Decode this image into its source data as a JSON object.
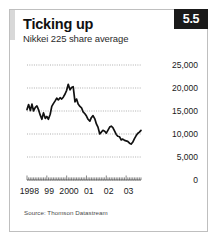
{
  "card": {
    "title": "Ticking up",
    "subtitle": "Nikkei 225 share average",
    "badge": "5.5",
    "source": "Source: Thomson Datastream",
    "accent_color": "#d8d8d8",
    "badge_bg": "#1a1a1a",
    "badge_fg": "#ffffff",
    "line_color": "#111111",
    "grid_color": "#9a9a9a",
    "border_color": "#bfbfbf"
  },
  "chart_data": {
    "type": "line",
    "title": "Ticking up",
    "subtitle": "Nikkei 225 share average",
    "xlabel": "",
    "ylabel": "",
    "ylim": [
      0,
      25000
    ],
    "xlim": [
      1998.0,
      2003.75
    ],
    "grid": true,
    "legend": null,
    "ytick_labels": [
      "25,000",
      "20,000",
      "15,000",
      "10,000",
      "5,000",
      "0"
    ],
    "ytick_values": [
      25000,
      20000,
      15000,
      10000,
      5000,
      0
    ],
    "xtick_labels": [
      "1998",
      "99",
      "2000",
      "01",
      "02",
      "03"
    ],
    "xtick_values": [
      1998,
      1999,
      2000,
      2001,
      2002,
      2003
    ],
    "series": [
      {
        "name": "Nikkei 225",
        "x": [
          1998.0,
          1998.08,
          1998.17,
          1998.25,
          1998.33,
          1998.42,
          1998.5,
          1998.58,
          1998.67,
          1998.75,
          1998.83,
          1998.92,
          1999.0,
          1999.08,
          1999.17,
          1999.25,
          1999.33,
          1999.42,
          1999.5,
          1999.58,
          1999.67,
          1999.75,
          1999.83,
          1999.92,
          2000.0,
          2000.08,
          2000.17,
          2000.25,
          2000.33,
          2000.42,
          2000.5,
          2000.58,
          2000.67,
          2000.75,
          2000.83,
          2000.92,
          2001.0,
          2001.08,
          2001.17,
          2001.25,
          2001.33,
          2001.42,
          2001.5,
          2001.58,
          2001.67,
          2001.75,
          2001.83,
          2001.92,
          2002.0,
          2002.08,
          2002.17,
          2002.25,
          2002.33,
          2002.42,
          2002.5,
          2002.58,
          2002.67,
          2002.75,
          2002.83,
          2002.92,
          2003.0,
          2003.08,
          2003.17,
          2003.25,
          2003.33,
          2003.42,
          2003.5,
          2003.58,
          2003.67,
          2003.75
        ],
        "values": [
          15300,
          16400,
          15100,
          16500,
          15000,
          15800,
          16100,
          15300,
          14100,
          13200,
          14600,
          13400,
          13800,
          13200,
          14300,
          16000,
          16600,
          17200,
          17800,
          17400,
          17900,
          17600,
          18000,
          18700,
          19500,
          20800,
          19600,
          20100,
          20300,
          17000,
          17600,
          16500,
          16000,
          15700,
          14800,
          14400,
          13900,
          13200,
          12800,
          13600,
          14000,
          13300,
          12200,
          11500,
          10000,
          10400,
          10800,
          10600,
          10200,
          10800,
          11500,
          11700,
          11400,
          10600,
          9900,
          9500,
          9400,
          8700,
          8900,
          8600,
          8500,
          8400,
          8000,
          7800,
          8200,
          9000,
          9600,
          10100,
          10400,
          10800
        ]
      }
    ],
    "annotations": []
  }
}
